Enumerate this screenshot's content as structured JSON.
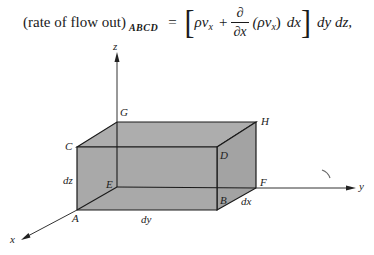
{
  "equation": {
    "lhs": "(rate of flow out)",
    "lhs_subscript": "ABCD",
    "equals": "=",
    "bracket_open": "[",
    "term1_rho": "ρ",
    "term1_v": "v",
    "term1_sub": "x",
    "plus": "+",
    "frac_num": "∂",
    "frac_den": "∂x",
    "term2": "(ρv",
    "term2_sub": "x",
    "term2_close": ")",
    "term2_dx": "dx",
    "bracket_close": "]",
    "tail": "dy dz,"
  },
  "diagram": {
    "box_fill": "#a9a9a9",
    "edge_color": "#1a1a1a",
    "vertices": {
      "A": {
        "label": "A"
      },
      "B": {
        "label": "B"
      },
      "C": {
        "label": "C"
      },
      "D": {
        "label": "D"
      },
      "E": {
        "label": "E"
      },
      "F": {
        "label": "F"
      },
      "G": {
        "label": "G"
      },
      "H": {
        "label": "H"
      }
    },
    "axes": {
      "x": "x",
      "y": "y",
      "z": "z"
    },
    "dimensions": {
      "dx": "dx",
      "dy": "dy",
      "dz": "dz"
    }
  }
}
